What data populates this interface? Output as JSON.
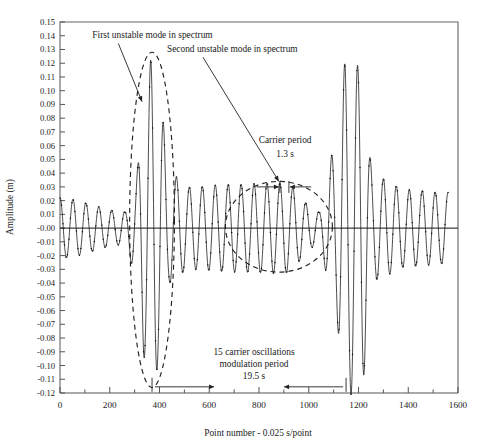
{
  "figure": {
    "background": "#ffffff",
    "plot_frame_color": "#666666",
    "series_color": "#111111",
    "envelope_color": "#222222"
  },
  "chart_data": {
    "type": "line",
    "title": "",
    "subtitle": "",
    "xlabel": "Point number - 0.025 s/point",
    "ylabel": "Amplitude (m)",
    "xlim": [
      0,
      1600
    ],
    "ylim": [
      -0.12,
      0.15
    ],
    "xticks": [
      0,
      200,
      400,
      600,
      800,
      1000,
      1200,
      1400,
      1600
    ],
    "xtick_labels": [
      "0",
      "200",
      "400",
      "600",
      "800",
      "1000",
      "1200",
      "1400",
      "1600"
    ],
    "x_minor_tick_step": 100,
    "yticks": [
      0.15,
      0.14,
      0.13,
      0.12,
      0.11,
      0.1,
      0.09,
      0.08,
      0.07,
      0.06,
      0.05,
      0.04,
      0.03,
      0.02,
      0.01,
      0.0,
      -0.01,
      -0.02,
      -0.03,
      -0.04,
      -0.05,
      -0.06,
      -0.07,
      -0.08,
      -0.09,
      -0.1,
      -0.11,
      -0.12
    ],
    "ytick_labels": [
      "0.15",
      "0.14",
      "0.13",
      "0.12",
      "0.11",
      "0.10",
      "0.09",
      "0.08",
      "0.07",
      "0.06",
      "0.05",
      "0.04",
      "0.03",
      "0.02",
      "0.01",
      "-0.00",
      "-0.01",
      "-0.02",
      "-0.03",
      "-0.04",
      "-0.05",
      "-0.06",
      "-0.07",
      "-0.08",
      "-0.09",
      "-0.10",
      "-0.11",
      "-0.12"
    ],
    "grid": false,
    "legend": null,
    "markers": "dots on line",
    "sampling": "0.025 s/point",
    "carrier_period_points": 52,
    "carrier_period_seconds": 1.3,
    "modulation_period_points": 780,
    "modulation_period_seconds": 19.5,
    "carrier_oscillations_per_modulation": 15,
    "series": [
      {
        "name": "Amplitude",
        "description": "Modulated carrier wave: carrier period 1.3 s (52 points) with a modulation period of 19.5 s (780 points); two unstable spectral modes produce large amplitude excursions near point 370 and point 1150.",
        "baseline": 0.0,
        "carrier_amplitude_background": 0.022,
        "peak_max": 0.125,
        "peak_min": -0.112,
        "envelope_control_points": [
          {
            "x": 0,
            "y": 0.022
          },
          {
            "x": 260,
            "y": 0.012
          },
          {
            "x": 300,
            "y": 0.03
          },
          {
            "x": 340,
            "y": 0.095
          },
          {
            "x": 370,
            "y": 0.125
          },
          {
            "x": 400,
            "y": 0.095
          },
          {
            "x": 440,
            "y": 0.04
          },
          {
            "x": 520,
            "y": 0.03
          },
          {
            "x": 700,
            "y": 0.032
          },
          {
            "x": 900,
            "y": 0.033
          },
          {
            "x": 1040,
            "y": 0.012
          },
          {
            "x": 1100,
            "y": 0.055
          },
          {
            "x": 1150,
            "y": 0.122
          },
          {
            "x": 1210,
            "y": 0.118
          },
          {
            "x": 1260,
            "y": 0.038
          },
          {
            "x": 1400,
            "y": 0.028
          },
          {
            "x": 1550,
            "y": 0.026
          }
        ]
      }
    ],
    "annotations": [
      {
        "id": "first-mode",
        "text": "First unstable mode in spectrum",
        "x": 130,
        "y": 0.138,
        "points_to": {
          "x": 330,
          "y": 0.092
        }
      },
      {
        "id": "second-mode",
        "text": "Second unstable mode in spectrum",
        "x": 430,
        "y": 0.128,
        "points_to": {
          "x": 880,
          "y": 0.034
        }
      },
      {
        "id": "carrier-period-label",
        "text": "Carrier period",
        "x": 905,
        "y": 0.062
      },
      {
        "id": "carrier-period-value",
        "text": "1.3 s",
        "x": 905,
        "y": 0.052
      },
      {
        "id": "modulation-count",
        "text": "15 carrier oscillations",
        "x": 780,
        "y": -0.092
      },
      {
        "id": "modulation-label",
        "text": "modulation period",
        "x": 780,
        "y": -0.101
      },
      {
        "id": "modulation-value",
        "text": "19.5 s",
        "x": 780,
        "y": -0.11
      }
    ],
    "dimension_lines": [
      {
        "id": "carrier-period-dim",
        "from_x": 790,
        "to_x": 1010,
        "tick_x": 900,
        "y": 0.03,
        "label": "1.3 s"
      },
      {
        "id": "modulation-period-dim",
        "from_x": 370,
        "to_x": 1150,
        "y": -0.1155,
        "label": "19.5 s"
      }
    ],
    "envelope_ellipses": [
      {
        "id": "first-mode-ellipse",
        "cx": 370,
        "cy": 0.006,
        "rx_points": 90,
        "ry": 0.122
      },
      {
        "id": "second-mode-ellipse",
        "cx": 880,
        "cy": 0.001,
        "rx_points": 215,
        "ry": 0.033
      }
    ]
  },
  "axis": {
    "y_label": "Amplitude (m)",
    "x_label": "Point number - 0.025 s/point"
  }
}
